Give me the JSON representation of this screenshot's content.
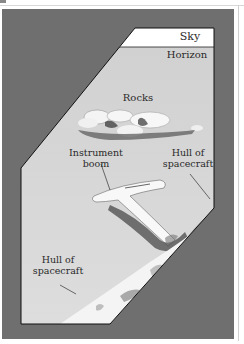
{
  "figure": {
    "labels": {
      "sky": "Sky",
      "horizon": "Horizon",
      "rocks": "Rocks",
      "instrument_boom_line1": "Instrument",
      "instrument_boom_line2": "boom",
      "hull_right_line1": "Hull of",
      "hull_right_line2": "spacecraft",
      "hull_left_line1": "Hull of",
      "hull_left_line2": "spacecraft"
    },
    "colors": {
      "frame": "#6f6f6f",
      "ground": "#d9d9d9",
      "sky": "#ffffff",
      "outline": "#1a1a1a",
      "hull": "#f2f2f2"
    }
  }
}
